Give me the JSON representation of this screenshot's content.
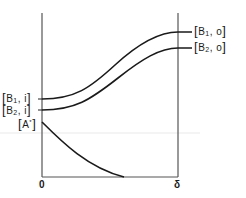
{
  "diagram": {
    "type": "concentration-profile",
    "axes": {
      "x_left_tick": "0",
      "x_right_tick": "δ"
    },
    "left_labels": [
      {
        "id": "b1i",
        "base": "B",
        "sub": "1",
        "suffix": ", i"
      },
      {
        "id": "b2i",
        "base": "B",
        "sub": "2",
        "suffix": ", i"
      },
      {
        "id": "astar",
        "base": "A",
        "sup": "*"
      }
    ],
    "right_labels": [
      {
        "id": "b1o",
        "base": "B",
        "sub": "1",
        "suffix": ", o"
      },
      {
        "id": "b2o",
        "base": "B",
        "sub": "2",
        "suffix": ", o"
      }
    ],
    "curves": [
      {
        "name": "B1",
        "from_label": "[B1,i]",
        "to_label": "[B1,o]",
        "trend": "increasing"
      },
      {
        "name": "B2",
        "from_label": "[B2,i]",
        "to_label": "[B2,o]",
        "trend": "increasing"
      },
      {
        "name": "A*",
        "from_label": "[A*]",
        "to_label": "0",
        "trend": "decreasing"
      }
    ],
    "colors": {
      "line": "#1a1a1a",
      "background": "#ffffff"
    }
  }
}
